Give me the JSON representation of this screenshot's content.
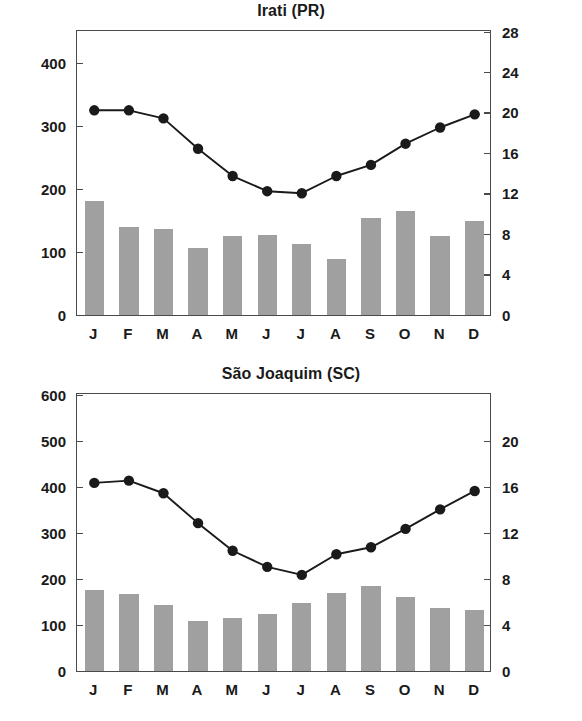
{
  "charts": [
    {
      "id": "irati",
      "title": "Irati (PR)",
      "left_axis_label": "Precipitação (mm)",
      "right_axis_label": "Temperatura (ºC)",
      "months": [
        "J",
        "F",
        "M",
        "A",
        "M",
        "J",
        "J",
        "A",
        "S",
        "O",
        "N",
        "D"
      ],
      "precip_ticks": [
        "0",
        "100",
        "200",
        "300",
        "400"
      ],
      "temp_ticks": [
        "0",
        "4",
        "8",
        "12",
        "16",
        "20",
        "24",
        "28"
      ],
      "precipitation": [
        182,
        140,
        137,
        106,
        125,
        128,
        113,
        89,
        155,
        165,
        125,
        149
      ],
      "temperature": [
        20.3,
        20.3,
        19.5,
        16.5,
        13.8,
        12.3,
        12.1,
        13.8,
        14.9,
        17.0,
        18.6,
        19.9
      ],
      "bar_color": "#a0a0a0",
      "line_color": "#1a1a1a"
    },
    {
      "id": "sao-joaquim",
      "title": "São Joaquim (SC)",
      "left_axis_label": "Precipitação (mm)",
      "right_axis_label": "Temperatura (ºC)",
      "months": [
        "J",
        "F",
        "M",
        "A",
        "M",
        "J",
        "J",
        "A",
        "S",
        "O",
        "N",
        "D"
      ],
      "precip_ticks": [
        "0",
        "100",
        "200",
        "300",
        "400",
        "500",
        "600"
      ],
      "temp_ticks": [
        "0",
        "4",
        "8",
        "12",
        "16",
        "20"
      ],
      "precipitation": [
        176,
        168,
        143,
        109,
        116,
        124,
        148,
        169,
        184,
        160,
        137,
        132
      ],
      "temperature": [
        16.4,
        16.6,
        15.5,
        12.9,
        10.5,
        9.1,
        8.4,
        10.2,
        10.8,
        12.4,
        14.1,
        15.7
      ],
      "bar_color": "#a0a0a0",
      "line_color": "#1a1a1a"
    }
  ],
  "chart_data": [
    {
      "type": "bar",
      "title": "Irati (PR)",
      "xlabel": "",
      "ylabel": "Precipitação (mm)",
      "y2label": "Temperatura (ºC)",
      "categories": [
        "J",
        "F",
        "M",
        "A",
        "M",
        "J",
        "J",
        "A",
        "S",
        "O",
        "N",
        "D"
      ],
      "ylim": [
        0,
        450
      ],
      "y2lim": [
        0,
        28
      ],
      "yticks": [
        0,
        100,
        200,
        300,
        400
      ],
      "y2ticks": [
        0,
        4,
        8,
        12,
        16,
        20,
        24,
        28
      ],
      "grid": false,
      "legend": "none",
      "series": [
        {
          "name": "Precipitação (mm)",
          "type": "bar",
          "axis": "left",
          "values": [
            182,
            140,
            137,
            106,
            125,
            128,
            113,
            89,
            155,
            165,
            125,
            149
          ]
        },
        {
          "name": "Temperatura (ºC)",
          "type": "line",
          "axis": "right",
          "values": [
            20.3,
            20.3,
            19.5,
            16.5,
            13.8,
            12.3,
            12.1,
            13.8,
            14.9,
            17.0,
            18.6,
            19.9
          ]
        }
      ]
    },
    {
      "type": "bar",
      "title": "São Joaquim (SC)",
      "xlabel": "",
      "ylabel": "Precipitação (mm)",
      "y2label": "Temperatura (ºC)",
      "categories": [
        "J",
        "F",
        "M",
        "A",
        "M",
        "J",
        "J",
        "A",
        "S",
        "O",
        "N",
        "D"
      ],
      "ylim": [
        0,
        600
      ],
      "y2lim": [
        0,
        24
      ],
      "yticks": [
        0,
        100,
        200,
        300,
        400,
        500,
        600
      ],
      "y2ticks": [
        0,
        4,
        8,
        12,
        16,
        20
      ],
      "grid": false,
      "legend": "none",
      "series": [
        {
          "name": "Precipitação (mm)",
          "type": "bar",
          "axis": "left",
          "values": [
            176,
            168,
            143,
            109,
            116,
            124,
            148,
            169,
            184,
            160,
            137,
            132
          ]
        },
        {
          "name": "Temperatura (ºC)",
          "type": "line",
          "axis": "right",
          "values": [
            16.4,
            16.6,
            15.5,
            12.9,
            10.5,
            9.1,
            8.4,
            10.2,
            10.8,
            12.4,
            14.1,
            15.7
          ]
        }
      ]
    }
  ]
}
